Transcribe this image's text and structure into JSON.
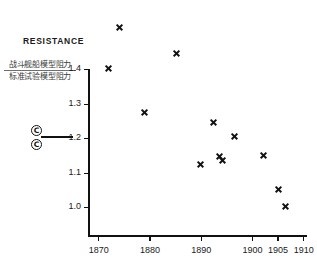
{
  "chart_data": {
    "type": "scatter",
    "title": "RESISTANCE",
    "ylabel_numerator": "战斗舰船模型阻力",
    "ylabel_denominator": "标准试验模型阻力",
    "xlabel": "",
    "xlim": [
      1868,
      1910
    ],
    "ylim": [
      0.93,
      1.45
    ],
    "grid": false,
    "legend": "none",
    "yticks": [
      "1.4",
      "1.3",
      "1.2",
      "1.1",
      "1.0"
    ],
    "ytick_values": [
      1.4,
      1.3,
      1.2,
      1.1,
      1.0
    ],
    "xticks": [
      "1870",
      "1880",
      "1890",
      "1900",
      "1905",
      "1910"
    ],
    "xtick_values": [
      1870,
      1880,
      1890,
      1900,
      1905,
      1910
    ],
    "x": [
      1874.2,
      1885.3,
      1872.0,
      1879.0,
      1890.0,
      1892.6,
      1893.7,
      1894.3,
      1896.6,
      1902.2,
      1905.2,
      1906.6
    ],
    "y": [
      1.52,
      1.445,
      1.402,
      1.275,
      1.123,
      1.245,
      1.148,
      1.134,
      1.205,
      1.15,
      1.05,
      1.002
    ],
    "points": [
      {
        "x": 1874.2,
        "y": 1.52,
        "offscale": true
      },
      {
        "x": 1885.3,
        "y": 1.445,
        "offscale": true
      },
      {
        "x": 1872.0,
        "y": 1.402,
        "offscale": false
      },
      {
        "x": 1879.0,
        "y": 1.275,
        "offscale": false
      },
      {
        "x": 1890.0,
        "y": 1.123,
        "offscale": false
      },
      {
        "x": 1892.6,
        "y": 1.245,
        "offscale": false
      },
      {
        "x": 1893.7,
        "y": 1.148,
        "offscale": false
      },
      {
        "x": 1894.3,
        "y": 1.134,
        "offscale": false
      },
      {
        "x": 1896.6,
        "y": 1.205,
        "offscale": false
      },
      {
        "x": 1902.2,
        "y": 1.15,
        "offscale": false
      },
      {
        "x": 1905.2,
        "y": 1.05,
        "offscale": false
      },
      {
        "x": 1906.6,
        "y": 1.002,
        "offscale": false
      }
    ],
    "marker": "x",
    "marker_color": "#111111",
    "axis_color": "#111111",
    "background": "#ffffff"
  },
  "annotations": {
    "circled_mark_top": "C",
    "circled_mark_bottom": "C"
  }
}
